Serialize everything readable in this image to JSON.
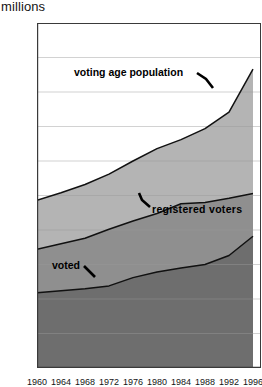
{
  "axis": {
    "unit_label": "millions",
    "y_ticks": [
      0,
      50,
      100,
      150,
      200,
      250,
      300,
      350,
      400,
      450,
      500
    ],
    "y_min": 0,
    "y_max": 500,
    "x_ticks": [
      "1960",
      "1964",
      "1968",
      "1972",
      "1976",
      "1980",
      "1984",
      "1988",
      "1992",
      "1996"
    ]
  },
  "labels": {
    "voting_age_population": "voting age population",
    "registered_voters": "registered  voters",
    "voted": "voted"
  },
  "colors": {
    "band_voted": "#6e6e6e",
    "band_registered": "#8f8f8f",
    "band_voting_age": "#b4b4b4",
    "axis": "#3a3a3a",
    "gridline": "#9a9a9a",
    "curve": "#111111",
    "background": "#ffffff"
  },
  "chart_data": {
    "type": "area",
    "title": "",
    "subtitle": "",
    "xlabel": "",
    "ylabel": "millions",
    "ylim": [
      0,
      500
    ],
    "grid": true,
    "stacked": false,
    "legend": "inline-annotations",
    "categories": [
      "1960",
      "1964",
      "1968",
      "1972",
      "1976",
      "1980",
      "1984",
      "1988",
      "1992",
      "1996"
    ],
    "series": [
      {
        "name": "voting age population",
        "values": [
          243,
          254,
          266,
          281,
          300,
          318,
          331,
          347,
          371,
          433
        ]
      },
      {
        "name": "registered voters",
        "values": [
          172,
          180,
          188,
          201,
          213,
          224,
          238,
          240,
          246,
          253
        ]
      },
      {
        "name": "voted",
        "values": [
          109,
          112,
          115,
          119,
          131,
          139,
          145,
          150,
          163,
          191
        ]
      }
    ],
    "annotations": [
      {
        "text": "voting age population",
        "points_to_series": "voting age population"
      },
      {
        "text": "registered  voters",
        "points_to_series": "registered voters"
      },
      {
        "text": "voted",
        "points_to_series": "voted"
      }
    ]
  }
}
